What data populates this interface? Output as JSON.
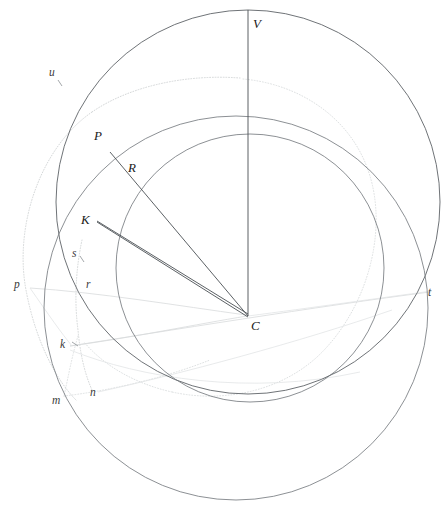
{
  "figure": {
    "kind": "geometric-construction-diagram",
    "width": 444,
    "height": 509,
    "background_color": "#ffffff",
    "stroke_colors": {
      "solid_dark": "#555a5e",
      "solid_mid": "#6e7478",
      "ray_line": "#4a4f53",
      "faint_gray": "#d8dadc",
      "dotted_gray": "#cfd2d4"
    }
  },
  "points": [
    {
      "id": "V",
      "label": "V",
      "x": 248,
      "y": 10,
      "label_x": 253,
      "label_y": 28,
      "style": "major"
    },
    {
      "id": "P",
      "label": "P",
      "x": 110,
      "y": 152,
      "label_x": 94,
      "label_y": 140,
      "style": "major"
    },
    {
      "id": "R",
      "label": "R",
      "x": 143,
      "y": 182,
      "label_x": 128,
      "label_y": 172,
      "style": "major"
    },
    {
      "id": "K",
      "label": "K",
      "x": 97,
      "y": 221,
      "label_x": 81,
      "label_y": 224,
      "style": "major"
    },
    {
      "id": "C",
      "label": "C",
      "x": 248,
      "y": 315,
      "label_x": 251,
      "label_y": 330,
      "style": "major"
    },
    {
      "id": "u",
      "label": "u",
      "x": 58,
      "y": 81,
      "label_x": 49,
      "label_y": 76,
      "style": "minor"
    },
    {
      "id": "s",
      "label": "s",
      "x": 79,
      "y": 260,
      "label_x": 72,
      "label_y": 257,
      "style": "minor"
    },
    {
      "id": "p",
      "label": "p",
      "x": 30,
      "y": 288,
      "label_x": 14,
      "label_y": 288,
      "style": "minor"
    },
    {
      "id": "r",
      "label": "r",
      "x": 92,
      "y": 289,
      "label_x": 86,
      "label_y": 288,
      "style": "minor"
    },
    {
      "id": "k",
      "label": "k",
      "x": 70,
      "y": 346,
      "label_x": 60,
      "label_y": 348,
      "style": "minor"
    },
    {
      "id": "m",
      "label": "m",
      "x": 64,
      "y": 399,
      "label_x": 52,
      "label_y": 404,
      "style": "minor"
    },
    {
      "id": "n",
      "label": "n",
      "x": 98,
      "y": 392,
      "label_x": 90,
      "label_y": 396,
      "style": "minor"
    },
    {
      "id": "t",
      "label": "t",
      "x": 430,
      "y": 292,
      "label_x": 428,
      "label_y": 296,
      "style": "minor"
    }
  ],
  "circles": [
    {
      "id": "primary-circle",
      "cx": 248,
      "cy": 202,
      "r": 192,
      "style": "solid_dark",
      "desc": "main great circle through V"
    },
    {
      "id": "secondary-circle",
      "cx": 250,
      "cy": 268,
      "r": 134,
      "style": "solid_mid",
      "desc": "inner circle through R and K"
    },
    {
      "id": "lower-circle",
      "cx": 236,
      "cy": 308,
      "r": 192,
      "style": "solid_mid",
      "desc": "lower large circle"
    }
  ],
  "ellipses": [
    {
      "id": "faint-ellipse-left",
      "cx": 150,
      "cy": 230,
      "rx": 138,
      "ry": 160,
      "rotate": -4,
      "style": "dotted_gray"
    },
    {
      "id": "faint-ellipse-inner",
      "cx": 232,
      "cy": 250,
      "rx": 118,
      "ry": 140,
      "rotate": 3,
      "style": "dotted_gray2"
    }
  ],
  "segments": [
    {
      "id": "VC",
      "from": "V",
      "to": "C",
      "desc": "vertical radius from V down to C"
    },
    {
      "id": "PC",
      "from": "P",
      "to": "C",
      "desc": "line from P through R to C"
    },
    {
      "id": "KC",
      "from": "K",
      "to": "C",
      "desc": "line from K to C"
    },
    {
      "id": "KC2",
      "from": "K",
      "to": "C",
      "desc": "second chord from K to C"
    }
  ],
  "labels_all": [
    "V",
    "P",
    "R",
    "K",
    "C",
    "u",
    "s",
    "p",
    "r",
    "k",
    "m",
    "n",
    "t"
  ],
  "caption": ""
}
